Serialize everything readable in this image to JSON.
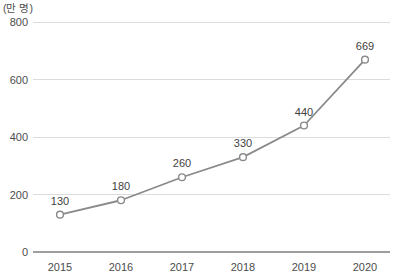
{
  "chart_data": {
    "type": "line",
    "title": "",
    "subtitle": "",
    "xlabel": "",
    "ylabel": "",
    "unit_label": "(만 명)",
    "categories": [
      "2015",
      "2016",
      "2017",
      "2018",
      "2019",
      "2020"
    ],
    "values": [
      130,
      180,
      260,
      330,
      440,
      669
    ],
    "point_labels": [
      "130",
      "180",
      "260",
      "330",
      "440",
      "669"
    ],
    "ylim": [
      0,
      800
    ],
    "yticks": [
      0,
      200,
      400,
      600,
      800
    ],
    "ytick_labels": [
      "0",
      "200",
      "400",
      "600",
      "800"
    ],
    "grid": true,
    "grid_axis": "y",
    "legend": false,
    "legend_position": "none",
    "series": [
      {
        "name": "",
        "values": [
          130,
          180,
          260,
          330,
          440,
          669
        ]
      }
    ],
    "colors": {
      "line": "#8a8a8a",
      "marker_stroke": "#8a8a8a",
      "marker_fill": "#ffffff",
      "grid": "#dcdcdc",
      "baseline": "#9e9e9e",
      "text": "#4d4d4d"
    }
  }
}
